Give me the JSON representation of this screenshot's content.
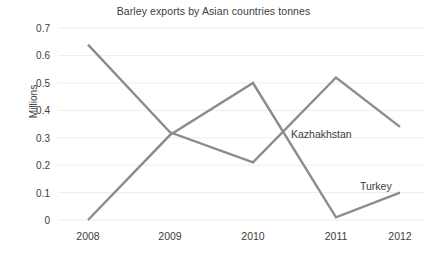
{
  "chart_data": {
    "type": "line",
    "title": "Barley exports by Asian countries tonnes",
    "xlabel": "",
    "ylabel": "Millions",
    "categories": [
      "2008",
      "2009",
      "2010",
      "2011",
      "2012"
    ],
    "x": [
      2008,
      2009,
      2010,
      2011,
      2012
    ],
    "series": [
      {
        "name": "Kazhakhstan",
        "values": [
          0.64,
          0.32,
          0.21,
          0.52,
          0.34
        ],
        "color": "#8c8c8c"
      },
      {
        "name": "Turkey",
        "values": [
          0.0,
          0.31,
          0.5,
          0.01,
          0.1
        ],
        "color": "#8c8c8c"
      }
    ],
    "ylim": [
      0,
      0.7
    ],
    "yticks": [
      "0",
      "0.1",
      "0.2",
      "0.3",
      "0.4",
      "0.5",
      "0.6",
      "0.7"
    ],
    "ytick_values": [
      0,
      0.1,
      0.2,
      0.3,
      0.4,
      0.5,
      0.6,
      0.7
    ],
    "grid": true,
    "grid_axis": "y",
    "grid_color": "#ededed",
    "legend": "none",
    "annotations": [
      {
        "text": "Kazhakhstan",
        "x": 291,
        "y": 128
      },
      {
        "text": "Turkey",
        "x": 360,
        "y": 180
      }
    ],
    "background": "#ffffff",
    "line_color": "#8c8c8c",
    "line_width": 2.4
  }
}
